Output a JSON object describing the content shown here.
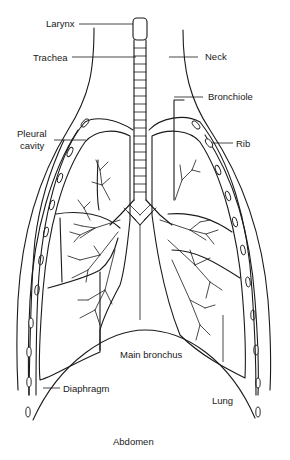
{
  "diagram": {
    "type": "anatomical-line-drawing",
    "labels": {
      "larynx": "Larynx",
      "trachea": "Trachea",
      "neck": "Neck",
      "bronchiole": "Bronchiole",
      "pleural_cavity_line1": "Pleural",
      "pleural_cavity_line2": "cavity",
      "rib": "Rib",
      "main_bronchus": "Main bronchus",
      "diaphragm": "Diaphragm",
      "lung": "Lung",
      "abdomen": "Abdomen"
    },
    "colors": {
      "line": "#1a1a1a",
      "background": "#ffffff"
    }
  }
}
